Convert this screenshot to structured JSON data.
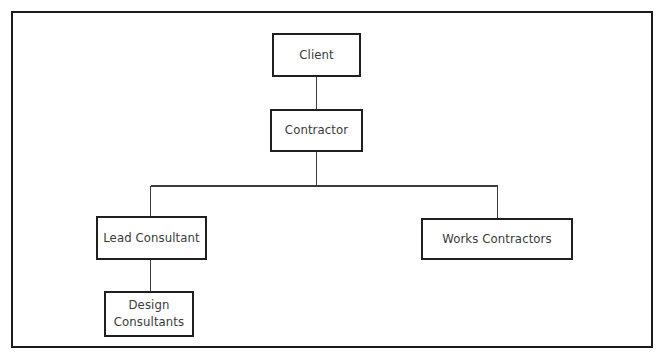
{
  "diagram": {
    "type": "organizational-hierarchy",
    "title": "",
    "background_color": "#ffffff",
    "frame": {
      "border_color": "#1b1b1b",
      "visible": true
    },
    "style": {
      "node_border_color": "#1f1f1f",
      "node_fill_color": "#ffffff",
      "text_color": "#3a3a3a",
      "connector_color": "#3b3b3b"
    },
    "nodes": [
      {
        "id": "client",
        "label": "Client",
        "level": 0
      },
      {
        "id": "contractor",
        "label": "Contractor",
        "level": 1
      },
      {
        "id": "lead",
        "label": "Lead Consultant",
        "level": 2
      },
      {
        "id": "works",
        "label": "Works Contractors",
        "level": 2
      },
      {
        "id": "design",
        "label": "Design\nConsultants",
        "level": 3
      }
    ],
    "edges": [
      {
        "from": "client",
        "to": "contractor"
      },
      {
        "from": "contractor",
        "to": "lead"
      },
      {
        "from": "contractor",
        "to": "works"
      },
      {
        "from": "lead",
        "to": "design"
      }
    ]
  }
}
